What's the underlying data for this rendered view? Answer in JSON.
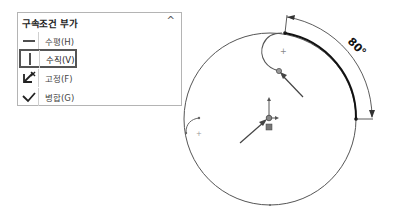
{
  "panel": {
    "title": "구속조건 부가",
    "collapse_icon": "chevron-up-icon",
    "collapse_glyph": "^",
    "items": [
      {
        "label": "수평(H)",
        "icon": "horizontal-icon",
        "selected": false
      },
      {
        "label": "수직(V)",
        "icon": "vertical-icon",
        "selected": true
      },
      {
        "label": "고정(F)",
        "icon": "fix-anchor-icon",
        "selected": false
      },
      {
        "label": "병합(G)",
        "icon": "merge-check-icon",
        "selected": false
      }
    ]
  },
  "sketch": {
    "dimension_label": "80°",
    "colors": {
      "line": "#555555",
      "bold": "#111111",
      "arrow": "#444444"
    }
  }
}
